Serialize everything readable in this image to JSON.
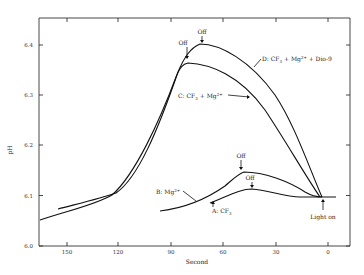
{
  "chart_data": {
    "type": "line",
    "title": "",
    "xlabel": "Second",
    "ylabel": "pH",
    "xlim": [
      160,
      -10
    ],
    "ylim": [
      6.0,
      6.45
    ],
    "x_ticks": [
      "150",
      "120",
      "90",
      "60",
      "30",
      "0"
    ],
    "y_ticks": [
      "6.0",
      "6.1",
      "6.2",
      "6.3",
      "6.4"
    ],
    "grid": false,
    "series": [
      {
        "name": "A: CF3",
        "label_main": "A: CF",
        "label_sub": "3",
        "x": [
          90,
          75,
          60,
          45,
          38,
          30,
          15,
          5,
          0,
          -5
        ],
        "y": [
          6.06,
          6.075,
          6.095,
          6.108,
          6.11,
          6.105,
          6.095,
          6.093,
          6.093,
          6.093
        ]
      },
      {
        "name": "B: Mg2+",
        "label_main": "B: Mg",
        "label_sup": "2+",
        "x": [
          135,
          110,
          90,
          70,
          60,
          50,
          44,
          30,
          15,
          5,
          0,
          -5
        ],
        "y": [
          6.07,
          6.075,
          6.083,
          6.1,
          6.12,
          6.14,
          6.145,
          6.135,
          6.115,
          6.097,
          6.093,
          6.093
        ]
      },
      {
        "name": "C: CF3 + Mg2+",
        "label_main": "C: CF",
        "label_sub": "3",
        "label_plus": " + Mg",
        "label_sup": "2+",
        "x": [
          160,
          140,
          120,
          105,
          95,
          85,
          80,
          70,
          55,
          40,
          25,
          10,
          5
        ],
        "y": [
          6.04,
          6.06,
          6.1,
          6.15,
          6.21,
          6.3,
          6.36,
          6.357,
          6.34,
          6.3,
          6.23,
          6.14,
          6.095
        ]
      },
      {
        "name": "D: CF3 + Mg2+ + Dio-9",
        "label_main": "D: CF",
        "label_sub": "3",
        "label_plus": " + Mg",
        "label_sup": "2+",
        "label_tail": " + Dio-9",
        "x": [
          150,
          130,
          120,
          105,
          95,
          85,
          79,
          73,
          60,
          45,
          30,
          15,
          5
        ],
        "y": [
          6.07,
          6.09,
          6.1,
          6.16,
          6.22,
          6.31,
          6.38,
          6.4,
          6.39,
          6.35,
          6.27,
          6.16,
          6.095
        ]
      }
    ],
    "annotations": [
      {
        "text": "Off",
        "target": "D peak"
      },
      {
        "text": "Off",
        "target": "C peak"
      },
      {
        "text": "Off",
        "target": "B peak"
      },
      {
        "text": "Off",
        "target": "A peak"
      },
      {
        "text": "Light on",
        "target": "x=0"
      }
    ]
  }
}
